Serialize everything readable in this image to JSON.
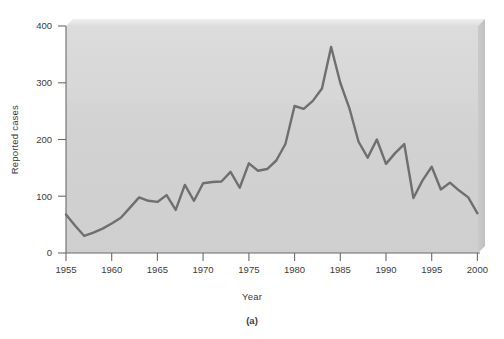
{
  "figure": {
    "caption": "(a)",
    "panel_background": "#d6d6d6",
    "line_color": "#6f6f6f",
    "axis_color": "#6b6b6b",
    "text_color": "#3b3b3b"
  },
  "chart_data": {
    "type": "line",
    "title": "",
    "subtitle": "",
    "xlabel": "Year",
    "ylabel": "Reported cases",
    "xlim": [
      1955,
      2000
    ],
    "ylim": [
      0,
      400
    ],
    "xticks": [
      1955,
      1960,
      1965,
      1970,
      1975,
      1980,
      1985,
      1990,
      1995,
      2000
    ],
    "xtick_labels": [
      "1955",
      "1960",
      "1965",
      "1970",
      "1975",
      "1980",
      "1985",
      "1990",
      "1995",
      "2000"
    ],
    "yticks": [
      0,
      100,
      200,
      300,
      400
    ],
    "ytick_labels": [
      "0",
      "100",
      "200",
      "300",
      "400"
    ],
    "grid": false,
    "legend": false,
    "legend_position": "none",
    "annotations": [
      "(a)"
    ],
    "x": [
      1955,
      1956,
      1957,
      1958,
      1959,
      1960,
      1961,
      1962,
      1963,
      1964,
      1965,
      1966,
      1967,
      1968,
      1969,
      1970,
      1971,
      1972,
      1973,
      1974,
      1975,
      1976,
      1977,
      1978,
      1979,
      1980,
      1981,
      1982,
      1983,
      1984,
      1985,
      1986,
      1987,
      1988,
      1989,
      1990,
      1991,
      1992,
      1993,
      1994,
      1995,
      1996,
      1997,
      1998,
      1999,
      2000
    ],
    "values": [
      68,
      48,
      30,
      36,
      43,
      52,
      62,
      80,
      98,
      92,
      90,
      102,
      76,
      120,
      92,
      123,
      125,
      126,
      143,
      115,
      158,
      145,
      148,
      163,
      192,
      259,
      254,
      268,
      290,
      363,
      300,
      255,
      196,
      168,
      200,
      157,
      176,
      192,
      97,
      128,
      152,
      112,
      124,
      110,
      98,
      70
    ],
    "series": [
      {
        "name": "Reported cases",
        "color": "#6f6f6f",
        "values": [
          68,
          48,
          30,
          36,
          43,
          52,
          62,
          80,
          98,
          92,
          90,
          102,
          76,
          120,
          92,
          123,
          125,
          126,
          143,
          115,
          158,
          145,
          148,
          163,
          192,
          259,
          254,
          268,
          290,
          363,
          300,
          255,
          196,
          168,
          200,
          157,
          176,
          192,
          97,
          128,
          152,
          112,
          124,
          110,
          98,
          70
        ]
      }
    ]
  }
}
